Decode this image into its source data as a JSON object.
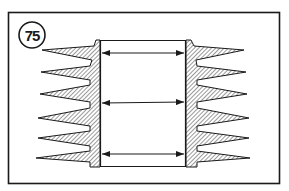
{
  "figure": {
    "number": "75",
    "colors": {
      "line": "#1a1a1a",
      "hatch": "#555555",
      "background": "#ffffff"
    },
    "measurements": [
      {
        "label": "top",
        "y": 53
      },
      {
        "label": "middle",
        "y": 103
      },
      {
        "label": "bottom",
        "y": 155
      }
    ]
  }
}
